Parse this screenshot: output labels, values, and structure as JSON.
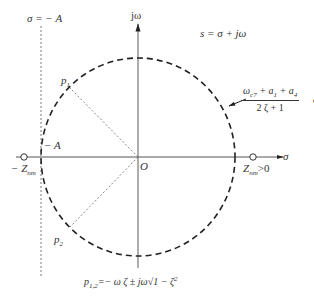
{
  "diagram": {
    "title_equation": "s = σ + jω",
    "axes": {
      "horizontal_label": "σ",
      "vertical_label": "jω",
      "origin_label": "O"
    },
    "vertical_line": {
      "label_top": "σ = − A",
      "label_intercept": "− A"
    },
    "zeros": {
      "left_label": "− Z",
      "left_sub": "nm",
      "right_label": "Z",
      "right_sub": "nm",
      "right_suffix": ">0"
    },
    "poles": {
      "p1_label": "p",
      "p1_sub": "1",
      "p2_label": "p",
      "p2_sub": "2"
    },
    "radius_annotation": {
      "numerator_a": "ω",
      "numerator_a_sub": "c7",
      "numerator_b": " + a",
      "numerator_b_sub": "1",
      "numerator_c": " + a",
      "numerator_c_sub": "4",
      "denominator": "2 ζ  + 1",
      "exp_base": "e",
      "exp_sup": "iθ"
    },
    "pole_formula": {
      "lhs": "p",
      "lhs_sub": "1,2",
      "rhs": "=− ω ζ ± jω√1 − ζ",
      "rhs_sup": "2"
    },
    "colors": {
      "axis": "#555555",
      "circle": "#222222",
      "guide": "#555555"
    }
  }
}
